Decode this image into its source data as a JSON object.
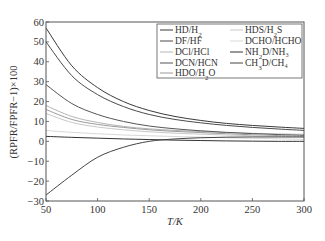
{
  "chart_data": {
    "type": "line",
    "title": "",
    "xlabel": "T/K",
    "ylabel": "(RPFR/FPFR−1)×100",
    "xlim": [
      50,
      300
    ],
    "ylim": [
      -30,
      60
    ],
    "xticks": [
      50,
      100,
      150,
      200,
      250,
      300
    ],
    "yticks": [
      -30,
      -20,
      -10,
      0,
      10,
      20,
      30,
      40,
      50,
      60
    ],
    "grid": false,
    "legend_position": "upper right",
    "x": [
      50,
      75,
      100,
      125,
      150,
      175,
      200,
      225,
      250,
      275,
      300
    ],
    "series": [
      {
        "name": "HD/H₂",
        "color": "#3a3a3a",
        "values": [
          57,
          38,
          27,
          20,
          15.5,
          12.5,
          10.5,
          9,
          8,
          7.2,
          6.5
        ]
      },
      {
        "name": "DF/HF",
        "color": "#4a4a4a",
        "values": [
          50,
          33,
          23.5,
          17.5,
          13.5,
          11,
          9.3,
          8,
          7,
          6.2,
          5.5
        ]
      },
      {
        "name": "DCl/HCl",
        "color": "#b5b5b5",
        "values": [
          18,
          12.5,
          9.5,
          7.5,
          6.3,
          5.5,
          4.9,
          4.4,
          4,
          3.7,
          3.5
        ]
      },
      {
        "name": "DCN/HCN",
        "color": "#555555",
        "values": [
          28.5,
          19,
          13.5,
          10,
          7.7,
          6.3,
          5.3,
          4.5,
          3.9,
          3.4,
          3
        ]
      },
      {
        "name": "HDO/H₂O",
        "color": "#9a9a9a",
        "values": [
          16,
          11,
          8.5,
          7,
          5.8,
          5,
          4.4,
          3.8,
          3.3,
          2.9,
          2.5
        ]
      },
      {
        "name": "HDS/H₂S",
        "color": "#c8c8c8",
        "values": [
          14,
          9.5,
          7.2,
          5.8,
          4.8,
          4.1,
          3.6,
          3.2,
          2.8,
          2.5,
          2.2
        ]
      },
      {
        "name": "DCHO/HCHO",
        "color": "#d8d8d8",
        "values": [
          5.5,
          4.5,
          3.8,
          3.2,
          2.8,
          2.4,
          2.1,
          1.8,
          1.5,
          1.3,
          1
        ]
      },
      {
        "name": "NH₂D/NH₃",
        "color": "#333333",
        "values": [
          2.5,
          2,
          1.6,
          1.2,
          0.9,
          0.6,
          0.4,
          0.2,
          0.1,
          0,
          0
        ]
      },
      {
        "name": "CH₃D/CH₄",
        "color": "#444444",
        "values": [
          -27,
          -17,
          -8,
          -3,
          0,
          1.2,
          1.8,
          2.1,
          2.2,
          2.2,
          2.2
        ]
      }
    ]
  },
  "legend": {
    "items": [
      {
        "label": "HD/H",
        "sub": "2",
        "tail": ""
      },
      {
        "label": "DF/HF",
        "sub": "",
        "tail": ""
      },
      {
        "label": "DCl/HCl",
        "sub": "",
        "tail": ""
      },
      {
        "label": "DCN/HCN",
        "sub": "",
        "tail": ""
      },
      {
        "label": "HDO/H",
        "sub": "2",
        "tail": "O"
      },
      {
        "label": "HDS/H",
        "sub": "2",
        "tail": "S"
      },
      {
        "label": "DCHO/HCHO",
        "sub": "",
        "tail": ""
      },
      {
        "label": "NH",
        "sub": "2",
        "tail": "D/NH₃"
      },
      {
        "label": "CH",
        "sub": "3",
        "tail": "D/CH₄"
      }
    ]
  }
}
